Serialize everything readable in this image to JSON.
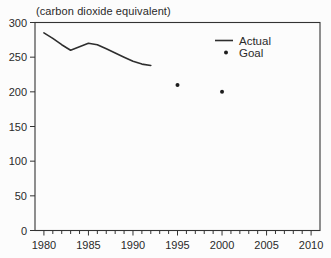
{
  "chart_data": {
    "type": "line",
    "title": "(carbon dioxide equivalent)",
    "xlabel": "",
    "ylabel": "",
    "xlim": [
      1979,
      2011
    ],
    "ylim": [
      0,
      300
    ],
    "x_major_ticks": [
      1980,
      1985,
      1990,
      1995,
      2000,
      2005,
      2010
    ],
    "x_minor_tick_interval": 1,
    "y_ticks": [
      0,
      50,
      100,
      150,
      200,
      250,
      300
    ],
    "grid": false,
    "plot_box": true,
    "legend_position": "top-right-inside",
    "series": [
      {
        "name": "Actual",
        "style": "line",
        "x": [
          1980,
          1981,
          1982,
          1983,
          1984,
          1985,
          1986,
          1987,
          1988,
          1989,
          1990,
          1991,
          1992
        ],
        "values": [
          285,
          277,
          268,
          260,
          265,
          270,
          268,
          262,
          256,
          250,
          244,
          240,
          238
        ]
      },
      {
        "name": "Goal",
        "style": "points",
        "x": [
          1995,
          2000
        ],
        "values": [
          210,
          200
        ]
      }
    ],
    "colors": {
      "line": "#2e2e2e",
      "point": "#1d1d1d",
      "axis": "#333333",
      "text": "#2a2a2a",
      "background": "#fcfcfc"
    }
  }
}
